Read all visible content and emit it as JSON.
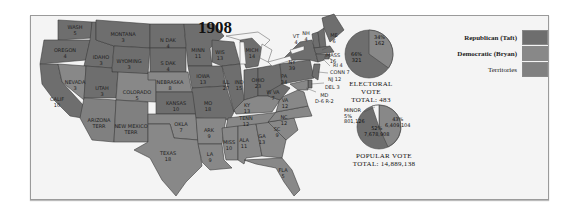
{
  "title": "1908",
  "legend": [
    {
      "label": "Republican (Taft)",
      "color": "#6e6e6e",
      "bold": true
    },
    {
      "label": "Democratic (Bryan)",
      "color": "#888888",
      "bold": true
    },
    {
      "label": "Territories",
      "color": "#808080",
      "bold": false
    }
  ],
  "states": {
    "wash": {
      "name": "WASH",
      "votes": "5"
    },
    "oregon": {
      "name": "OREGON",
      "votes": "4"
    },
    "calif": {
      "name": "CALIF",
      "votes": "10"
    },
    "idaho": {
      "name": "IDAHO",
      "votes": "3"
    },
    "nevada": {
      "name": "NEVADA",
      "votes": "3"
    },
    "montana": {
      "name": "MONTANA",
      "votes": "3"
    },
    "wyoming": {
      "name": "WYOMING",
      "votes": "3"
    },
    "utah": {
      "name": "UTAH",
      "votes": "3"
    },
    "colorado": {
      "name": "COLORADO",
      "votes": "5"
    },
    "arizona": {
      "name": "ARIZONA",
      "votes": "TERR"
    },
    "new_mexico": {
      "name": "NEW MEXICO",
      "votes": "TERR"
    },
    "n_dak": {
      "name": "N DAK",
      "votes": "4"
    },
    "s_dak": {
      "name": "S DAK",
      "votes": "4"
    },
    "nebraska": {
      "name": "NEBRASKA",
      "votes": "8"
    },
    "kansas": {
      "name": "KANSAS",
      "votes": "10"
    },
    "okla": {
      "name": "OKLA",
      "votes": "7"
    },
    "texas": {
      "name": "TEXAS",
      "votes": "18"
    },
    "minn": {
      "name": "MINN",
      "votes": "11"
    },
    "iowa": {
      "name": "IOWA",
      "votes": "13"
    },
    "mo": {
      "name": "MO",
      "votes": "18"
    },
    "ark": {
      "name": "ARK",
      "votes": "9"
    },
    "la": {
      "name": "LA",
      "votes": "9"
    },
    "wis": {
      "name": "WIS",
      "votes": "13"
    },
    "ill": {
      "name": "ILL",
      "votes": "27"
    },
    "mich": {
      "name": "MICH",
      "votes": "14"
    },
    "ind": {
      "name": "IND",
      "votes": "15"
    },
    "ohio": {
      "name": "OHIO",
      "votes": "23"
    },
    "ky": {
      "name": "KY",
      "votes": "13"
    },
    "tenn": {
      "name": "TENN",
      "votes": "12"
    },
    "miss": {
      "name": "MISS",
      "votes": "10"
    },
    "ala": {
      "name": "ALA",
      "votes": "11"
    },
    "ga": {
      "name": "GA",
      "votes": "13"
    },
    "fla": {
      "name": "FLA",
      "votes": "5"
    },
    "sc": {
      "name": "SC",
      "votes": "9"
    },
    "nc": {
      "name": "NC",
      "votes": "12"
    },
    "va": {
      "name": "VA",
      "votes": "12"
    },
    "w_va": {
      "name": "W VA",
      "votes": "7"
    },
    "pa": {
      "name": "PA",
      "votes": "34"
    },
    "ny": {
      "name": "NY",
      "votes": "39"
    },
    "vt": {
      "name": "VT",
      "votes": "4"
    },
    "nh": {
      "name": "NH",
      "votes": "4"
    },
    "me": {
      "name": "ME",
      "votes": "6"
    },
    "mass": {
      "name": "MASS",
      "votes": "16"
    },
    "ri": {
      "name": "RI",
      "votes": "4"
    },
    "conn": {
      "name": "CONN",
      "votes": "7"
    },
    "nj": {
      "name": "NJ",
      "votes": "12"
    },
    "del": {
      "name": "DEL",
      "votes": "3"
    },
    "md": {
      "name": "MD",
      "votes": "D-6 R-2"
    }
  },
  "electoral_vote": {
    "title": "ELECTORAL VOTE",
    "total_label": "TOTAL: 483",
    "slices": [
      {
        "party": "Democratic",
        "pct": "34%",
        "value": "162"
      },
      {
        "party": "Republican",
        "pct": "66%",
        "value": "321"
      }
    ]
  },
  "popular_vote": {
    "title": "POPULAR VOTE",
    "total_label": "TOTAL: 14,889,138",
    "slices": [
      {
        "party": "Minor",
        "label": "MINOR",
        "pct": "5%",
        "value": "801,126"
      },
      {
        "party": "Democratic",
        "pct": "43%",
        "value": "6,409,104"
      },
      {
        "party": "Republican",
        "pct": "52%",
        "value": "7,678,908"
      }
    ]
  }
}
